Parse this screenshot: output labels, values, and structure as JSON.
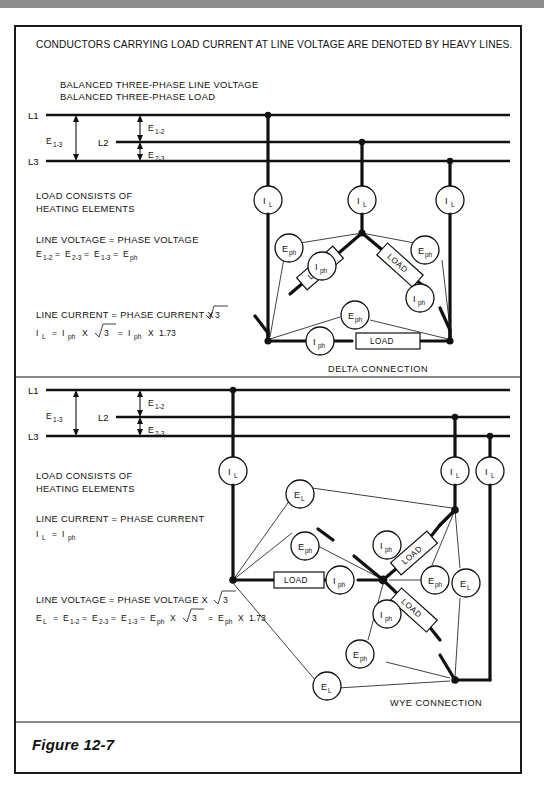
{
  "figure": {
    "label": "Figure 12-7"
  },
  "header": {
    "note": "CONDUCTORS CARRYING LOAD CURRENT AT LINE VOLTAGE ARE DENOTED BY HEAVY LINES."
  },
  "delta_section": {
    "headings": [
      "BALANCED THREE-PHASE LINE VOLTAGE",
      "BALANCED THREE-PHASE LOAD"
    ],
    "rails": [
      {
        "name": "L1"
      },
      {
        "name": "L2"
      },
      {
        "name": "L3"
      }
    ],
    "dimensions": [
      {
        "base": "E",
        "sub": "1-3"
      },
      {
        "base": "E",
        "sub": "1-2"
      },
      {
        "base": "E",
        "sub": "2-3"
      }
    ],
    "notes": [
      "LOAD CONSISTS OF",
      "HEATING ELEMENTS"
    ],
    "voltage_rule": {
      "text": "LINE VOLTAGE = PHASE VOLTAGE",
      "formula_parts": [
        {
          "base": "E",
          "sub": "1-2"
        },
        {
          "op": "="
        },
        {
          "base": "E",
          "sub": "2-3"
        },
        {
          "op": "="
        },
        {
          "base": "E",
          "sub": "1-3"
        },
        {
          "op": "="
        },
        {
          "base": "E",
          "sub": "ph"
        }
      ]
    },
    "current_rule": {
      "text": "LINE CURRENT = PHASE CURRENT X",
      "radical": "3",
      "formula_line": {
        "i_l": {
          "base": "I",
          "sub": "L"
        },
        "eq1": "=",
        "i_ph1": {
          "base": "I",
          "sub": "ph"
        },
        "times1": "X",
        "radical": "3",
        "eq2": "=",
        "i_ph2": {
          "base": "I",
          "sub": "ph"
        },
        "times2": "X",
        "factor": "1.73"
      }
    },
    "line_currents": [
      {
        "base": "I",
        "sub": "L"
      },
      {
        "base": "I",
        "sub": "L"
      },
      {
        "base": "I",
        "sub": "L"
      }
    ],
    "phase_currents": [
      {
        "base": "I",
        "sub": "ph"
      },
      {
        "base": "I",
        "sub": "ph"
      },
      {
        "base": "I",
        "sub": "ph"
      }
    ],
    "phase_voltages": [
      {
        "base": "E",
        "sub": "ph"
      },
      {
        "base": "E",
        "sub": "ph"
      },
      {
        "base": "E",
        "sub": "ph"
      }
    ],
    "loads": [
      "LOAD",
      "LOAD",
      "LOAD"
    ],
    "connection_name": "DELTA CONNECTION"
  },
  "wye_section": {
    "rails": [
      {
        "name": "L1"
      },
      {
        "name": "L2"
      },
      {
        "name": "L3"
      }
    ],
    "dimensions": [
      {
        "base": "E",
        "sub": "1-3"
      },
      {
        "base": "E",
        "sub": "1-2"
      },
      {
        "base": "E",
        "sub": "2-3"
      }
    ],
    "notes": [
      "LOAD CONSISTS OF",
      "HEATING ELEMENTS"
    ],
    "current_rule": {
      "text": "LINE CURRENT = PHASE CURRENT",
      "formula_parts": [
        {
          "base": "I",
          "sub": "L"
        },
        {
          "op": "="
        },
        {
          "base": "I",
          "sub": "ph"
        }
      ]
    },
    "voltage_rule": {
      "text": "LINE VOLTAGE = PHASE VOLTAGE X",
      "radical": "3",
      "formula_line": {
        "e_l": {
          "base": "E",
          "sub": "L"
        },
        "eq1": "=",
        "e12": {
          "base": "E",
          "sub": "1-2"
        },
        "eq2": "=",
        "e23": {
          "base": "E",
          "sub": "2-3"
        },
        "eq3": "=",
        "e13": {
          "base": "E",
          "sub": "1-3"
        },
        "eq4": "=",
        "e_ph1": {
          "base": "E",
          "sub": "ph"
        },
        "times1": "X",
        "radical": "3",
        "eq5": "=",
        "e_ph2": {
          "base": "E",
          "sub": "ph"
        },
        "times2": "X",
        "factor": "1.73"
      }
    },
    "line_currents": [
      {
        "base": "I",
        "sub": "L"
      },
      {
        "base": "I",
        "sub": "L"
      },
      {
        "base": "I",
        "sub": "L"
      }
    ],
    "phase_currents": [
      {
        "base": "I",
        "sub": "ph"
      },
      {
        "base": "I",
        "sub": "ph"
      },
      {
        "base": "I",
        "sub": "ph"
      }
    ],
    "phase_voltages": [
      {
        "base": "E",
        "sub": "ph"
      },
      {
        "base": "E",
        "sub": "ph"
      },
      {
        "base": "E",
        "sub": "ph"
      }
    ],
    "line_voltages": [
      {
        "base": "E",
        "sub": "L"
      },
      {
        "base": "E",
        "sub": "L"
      },
      {
        "base": "E",
        "sub": "L"
      }
    ],
    "loads": [
      "LOAD",
      "LOAD",
      "LOAD"
    ],
    "connection_name": "WYE CONNECTION"
  },
  "colors": {
    "ink": "#111111",
    "paper": "#ffffff",
    "backdrop": "#a9a9a9"
  }
}
